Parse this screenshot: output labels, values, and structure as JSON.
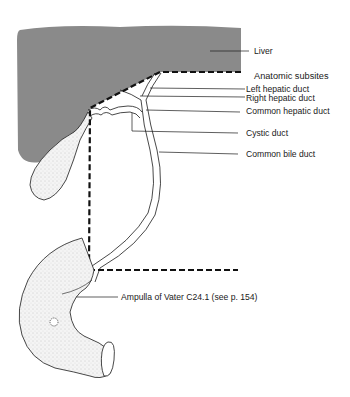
{
  "diagram": {
    "type": "anatomical-illustration",
    "colors": {
      "liver_fill": "#8a8a8a",
      "line": "#1a1a1a",
      "gallbladder_fill": "#f2f2f2",
      "background": "#ffffff"
    },
    "labels": {
      "liver": "Liver",
      "anatomic_subsites": "Anatomic subsites",
      "left_hepatic_duct": "Left hepatic duct",
      "right_hepatic_duct": "Right hepatic duct",
      "common_hepatic_duct": "Common hepatic duct",
      "cystic_duct": "Cystic duct",
      "common_bile_duct": "Common bile duct",
      "ampulla": "Ampulla of Vater C24.1 (see p. 154)"
    }
  }
}
